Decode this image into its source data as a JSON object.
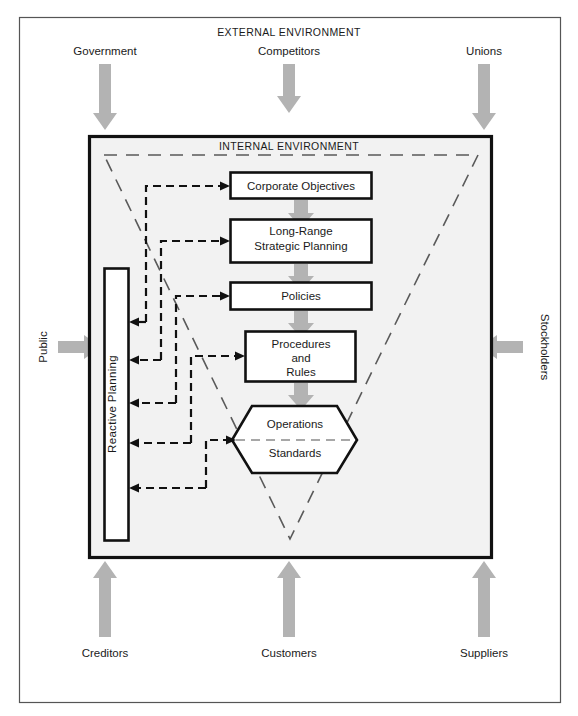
{
  "figure": {
    "external_environment_label": "EXTERNAL ENVIRONMENT",
    "internal_environment_label": "INTERNAL ENVIRONMENT"
  },
  "external_actors": {
    "top": [
      {
        "name": "government",
        "label": "Government",
        "direction": "down"
      },
      {
        "name": "competitors",
        "label": "Competitors",
        "direction": "down"
      },
      {
        "name": "unions",
        "label": "Unions",
        "direction": "down"
      }
    ],
    "left": [
      {
        "name": "public",
        "label": "Public",
        "direction": "right"
      }
    ],
    "right": [
      {
        "name": "stockholders",
        "label": "Stockholders",
        "direction": "left"
      }
    ],
    "bottom": [
      {
        "name": "creditors",
        "label": "Creditors",
        "direction": "up"
      },
      {
        "name": "customers",
        "label": "Customers",
        "direction": "up"
      },
      {
        "name": "suppliers",
        "label": "Suppliers",
        "direction": "up"
      }
    ]
  },
  "planning_hierarchy": [
    {
      "name": "corporate-objectives",
      "label": "Corporate  Objectives",
      "shape": "rect"
    },
    {
      "name": "long-range-strategic-planning",
      "label_line1": "Long-Range",
      "label_line2": "Strategic Planning",
      "shape": "rect"
    },
    {
      "name": "policies",
      "label": "Policies",
      "shape": "rect"
    },
    {
      "name": "procedures-and-rules",
      "label_line1": "Procedures",
      "label_line2": "and",
      "label_line3": "Rules",
      "shape": "rect"
    },
    {
      "name": "operations-standards",
      "label_line1": "Operations",
      "label_line2": "Standards",
      "shape": "hexagon"
    }
  ],
  "reactive_planning": {
    "label": "Reactive Planning"
  },
  "colors": {
    "actor_arrow": "#b3b3b3",
    "internal_fill": "#f2f2f2",
    "node_stroke": "#111111",
    "feedback_line": "#111111",
    "triangle_dash": "#5a5a5a",
    "page_background": "#ffffff"
  }
}
